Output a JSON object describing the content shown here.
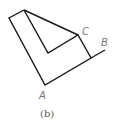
{
  "figure": {
    "caption": "(b)",
    "labels": {
      "a": "A",
      "b": "B",
      "c": "C"
    },
    "stroke_color": "#1a1a1a",
    "label_color": "#777777"
  }
}
